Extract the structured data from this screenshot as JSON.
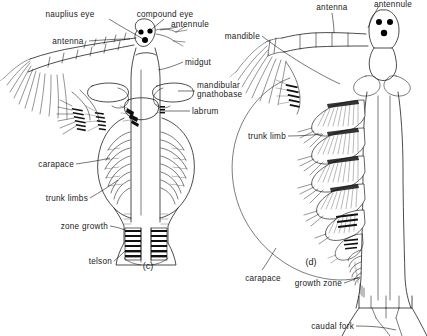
{
  "figure": {
    "background_color": "#ffffff",
    "ink_color": "#111111",
    "panels": [
      {
        "id": "panel-c",
        "caption": "(c)"
      },
      {
        "id": "panel-d",
        "caption": "(d)"
      }
    ]
  },
  "labels": {
    "nauplius_eye": "nauplius eye",
    "compound_eye": "compound eye",
    "antennule": "antennule",
    "antenna": "antenna",
    "midgut": "midgut",
    "mandibular": "mandibular",
    "gnathobase": "gnathobase",
    "labrum": "labrum",
    "carapace": "carapace",
    "trunk_limbs": "trunk limbs",
    "zone_growth": "zone growth",
    "telson": "telson",
    "mandible": "mandible",
    "antenna_right": "antenna",
    "antennule_right": "antennule",
    "trunk_limb": "trunk limb",
    "carapace_right": "carapace",
    "growth_zone": "growth zone",
    "caudal_fork": "caudal fork"
  },
  "panel_c": {
    "caption": "(c)",
    "parts": [
      "nauplius eye",
      "compound eye",
      "antennule",
      "antenna",
      "midgut",
      "mandibular gnathobase",
      "labrum",
      "carapace",
      "trunk limbs",
      "zone growth",
      "telson"
    ]
  },
  "panel_d": {
    "caption": "(d)",
    "parts": [
      "antenna",
      "antennule",
      "mandible",
      "trunk limb",
      "carapace",
      "growth zone",
      "caudal fork"
    ]
  }
}
